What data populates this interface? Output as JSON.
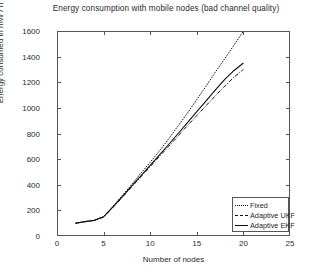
{
  "chart_data": {
    "type": "line",
    "title": "Energy consumption with mobile nodes (bad channel quality)",
    "xlabel": "Number of nodes",
    "ylabel": "Energy consumed in mW / h",
    "xlim": [
      0,
      25
    ],
    "ylim": [
      0,
      1600
    ],
    "xticks": [
      0,
      5,
      10,
      15,
      20,
      25
    ],
    "yticks": [
      0,
      200,
      400,
      600,
      800,
      1000,
      1200,
      1400,
      1600
    ],
    "grid": false,
    "legend_position": "lower right",
    "series": [
      {
        "name": "Fixed",
        "style": "dotted",
        "color": "#111111",
        "x": [
          2,
          3,
          4,
          5,
          6,
          7,
          8,
          9,
          10,
          11,
          12,
          13,
          14,
          15,
          16,
          17,
          18,
          19,
          20
        ],
        "values": [
          100,
          112,
          122,
          150,
          230,
          315,
          400,
          490,
          575,
          665,
          760,
          860,
          960,
          1065,
          1170,
          1280,
          1385,
          1490,
          1600
        ]
      },
      {
        "name": "Adaptive UKF",
        "style": "dash-dot",
        "color": "#111111",
        "x": [
          2,
          3,
          4,
          5,
          6,
          7,
          8,
          9,
          10,
          11,
          12,
          13,
          14,
          15,
          16,
          17,
          18,
          19,
          20
        ],
        "values": [
          100,
          112,
          122,
          148,
          222,
          300,
          382,
          462,
          542,
          622,
          700,
          782,
          862,
          940,
          1018,
          1095,
          1170,
          1240,
          1300
        ]
      },
      {
        "name": "Adaptive EKF",
        "style": "solid",
        "color": "#111111",
        "x": [
          2,
          3,
          4,
          5,
          6,
          7,
          8,
          9,
          10,
          11,
          12,
          13,
          14,
          15,
          16,
          17,
          18,
          19,
          20
        ],
        "values": [
          100,
          112,
          122,
          150,
          228,
          308,
          390,
          470,
          552,
          634,
          716,
          800,
          885,
          970,
          1055,
          1140,
          1222,
          1292,
          1350
        ]
      }
    ]
  },
  "legend": {
    "items": [
      {
        "label": "Fixed"
      },
      {
        "label": "Adaptive UKF"
      },
      {
        "label": "Adaptive EKF"
      }
    ]
  }
}
